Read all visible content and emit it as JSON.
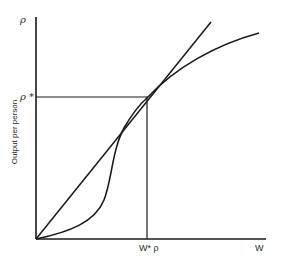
{
  "diagram": {
    "type": "economic-diagram",
    "y_axis": {
      "top_label": "ρ",
      "title": "Output per person",
      "marked_value_label": "ρ *"
    },
    "x_axis": {
      "end_label": "W",
      "marked_value_label": "W* ρ"
    },
    "elements": [
      {
        "name": "straight-line-from-origin",
        "description": "Ray from origin through (W*, ρ*)"
      },
      {
        "name": "s-shaped-output-curve",
        "description": "Convex then concave curve tangent to the ray at (W*, ρ*)"
      },
      {
        "name": "horizontal-reference-line",
        "description": "Horizontal line at ρ* from y-axis to tangency point"
      },
      {
        "name": "vertical-reference-line",
        "description": "Vertical line at W* from x-axis to tangency point"
      }
    ],
    "line_color": "#1a1a1a",
    "background": "#ffffff"
  }
}
